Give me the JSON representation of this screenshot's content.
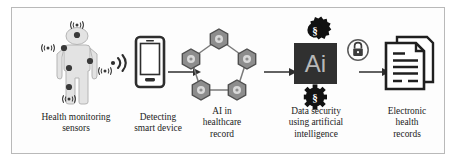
{
  "figure": {
    "type": "process-flow-diagram",
    "title": "",
    "background_color": "#ffffff",
    "frame_color": "#b9b9b9",
    "panel_color": "#fdfdfd"
  },
  "palette": {
    "ink": "#1c1c1c",
    "dark": "#2e2e2e",
    "body_fill": "#e3e3e3",
    "body_stroke": "#b5b5b5",
    "hex_fill": "#8d8d8d",
    "hex_stroke": "#5d5d5d",
    "hex_inner": "#d7d7d7",
    "ai_block": "#303030",
    "ai_text": "#b8b8b8",
    "lock_stroke": "#5a5a5a",
    "line": "#2e2e2e"
  },
  "stages": [
    {
      "id": "health-monitoring-sensors",
      "caption": "Health monitoring\nsensors",
      "caption_lines": [
        "Health monitoring",
        "sensors"
      ],
      "icon": "body-sensors-icon",
      "icon_description": "human figure with wireless body sensors",
      "sensor_count": 5,
      "sensor_labels": [
        "head",
        "left-shoulder",
        "right-arm",
        "abdomen",
        "leg"
      ]
    },
    {
      "id": "detecting-smart-device",
      "caption": "Detecting\nsmart device",
      "caption_lines": [
        "Detecting",
        "smart device"
      ],
      "icon": "smartphone-icon",
      "icon_description": "smartphone receiving a wireless signal",
      "signal_icon": "wireless-signal-icon"
    },
    {
      "id": "ai-in-healthcare-record",
      "caption": "AI in\nhealthcare\nrecord",
      "caption_lines": [
        "AI in",
        "healthcare",
        "record"
      ],
      "icon": "hexagon-network-icon",
      "icon_description": "pentagon network of five linked gear hexagons",
      "node_count": 5
    },
    {
      "id": "data-security-using-artificial-intelligence",
      "caption": "Data security\nusing artificial\nintelligence",
      "caption_lines": [
        "Data security",
        "using artificial",
        "intelligence"
      ],
      "icon": "ai-security-icon",
      "icon_description": "Ai block flanked by section-symbol gears with a padlock",
      "block_label": "Ai",
      "gear_label": "§",
      "lock_icon": "padlock-icon"
    },
    {
      "id": "electronic-health-records",
      "caption": "Electronic\nhealth\nrecords",
      "caption_lines": [
        "Electronic",
        "health",
        "records"
      ],
      "icon": "documents-icon",
      "icon_description": "stack of two documents with text lines and folded corner"
    }
  ],
  "arrows": [
    {
      "id": "arrow-phone-to-network",
      "from": "detecting-smart-device",
      "to": "ai-in-healthcare-record",
      "direction": "right"
    },
    {
      "id": "arrow-network-to-ai",
      "from": "ai-in-healthcare-record",
      "to": "data-security-using-artificial-intelligence",
      "direction": "right"
    },
    {
      "id": "arrow-ai-to-documents",
      "from": "data-security-using-artificial-intelligence",
      "to": "electronic-health-records",
      "direction": "right"
    }
  ]
}
